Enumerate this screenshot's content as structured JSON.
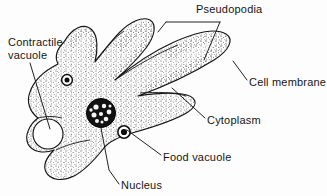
{
  "figure": {
    "background_color": "#fdfdfd",
    "ink_color": "#151515"
  },
  "labels": {
    "pseudopodia": "Pseudopodia",
    "contractile_vacuole_line1": "Contractile",
    "contractile_vacuole_line2": "vacuole",
    "cell_membrane": "Cell membrane",
    "cytoplasm": "Cytoplasm",
    "food_vacuole": "Food vacuole",
    "nucleus": "Nucleus"
  },
  "structures": [
    {
      "name": "cell-membrane",
      "description": "outer boundary of the cell"
    },
    {
      "name": "cytoplasm",
      "description": "stippled interior of the cell"
    },
    {
      "name": "nucleus",
      "description": "dark speckled sphere near cell centre"
    },
    {
      "name": "contractile-vacuole",
      "description": "large clear circle at left of cell"
    },
    {
      "name": "food-vacuole",
      "description": "small dark ring right of nucleus"
    },
    {
      "name": "pseudopodia",
      "description": "finger-like projections of the cell"
    }
  ]
}
